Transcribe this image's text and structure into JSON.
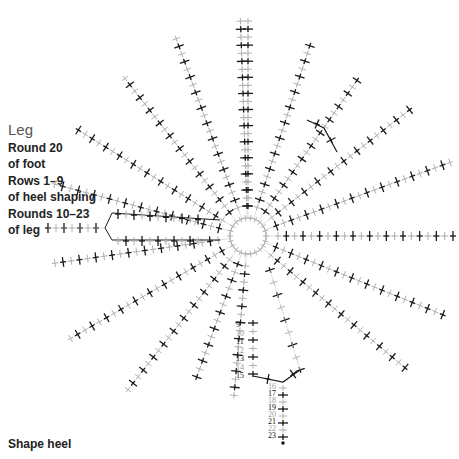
{
  "legend": {
    "title": "Leg",
    "lines": [
      "Round 20",
      "of foot",
      "Rows 1–9",
      "of heel shaping",
      "Rounds 10–23",
      "of leg"
    ]
  },
  "footer": {
    "label": "Shape heel"
  },
  "diagram": {
    "center": [
      248,
      236
    ],
    "ring_radius": 18,
    "colors": {
      "dark": "#1a1a1a",
      "light": "#b0b0b0",
      "guide": "#d8d8d8"
    },
    "spokes_deg": [
      -90,
      -72,
      -55,
      -38,
      -20,
      0,
      22,
      40,
      70,
      95,
      110,
      128,
      150,
      172,
      195,
      212,
      232,
      250,
      268
    ],
    "row_numbers_left": [
      {
        "n": "9",
        "dark": true
      },
      {
        "n": "10",
        "dark": false
      },
      {
        "n": "11",
        "dark": true
      },
      {
        "n": "12",
        "dark": false
      },
      {
        "n": "13",
        "dark": true
      },
      {
        "n": "14",
        "dark": false
      },
      {
        "n": "15",
        "dark": true
      }
    ],
    "row_numbers_right": [
      {
        "n": "16",
        "dark": false
      },
      {
        "n": "17",
        "dark": true
      },
      {
        "n": "18",
        "dark": false
      },
      {
        "n": "19",
        "dark": true
      },
      {
        "n": "20",
        "dark": false
      },
      {
        "n": "21",
        "dark": true
      },
      {
        "n": "22",
        "dark": false
      },
      {
        "n": "23",
        "dark": true
      }
    ],
    "ring_labels": [
      "1",
      "2",
      "3",
      "4",
      "5",
      "6",
      "7",
      "8",
      "1",
      "2b"
    ]
  }
}
